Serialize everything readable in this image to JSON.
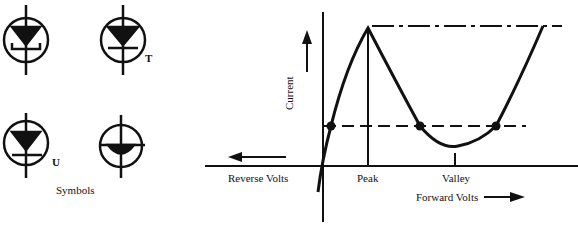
{
  "symbols": {
    "caption": "Symbols",
    "items": [
      {
        "id": "symbol-1",
        "label": ""
      },
      {
        "id": "symbol-2",
        "label": "T"
      },
      {
        "id": "symbol-3",
        "label": "U"
      },
      {
        "id": "symbol-4",
        "label": ""
      }
    ]
  },
  "graph": {
    "y_axis_label": "Current",
    "peak_label": "Peak",
    "valley_label": "Valley",
    "reverse_label": "Reverse Volts",
    "forward_label": "Forward Volts"
  },
  "colors": {
    "ink": "#111111",
    "background": "#ffffff"
  }
}
